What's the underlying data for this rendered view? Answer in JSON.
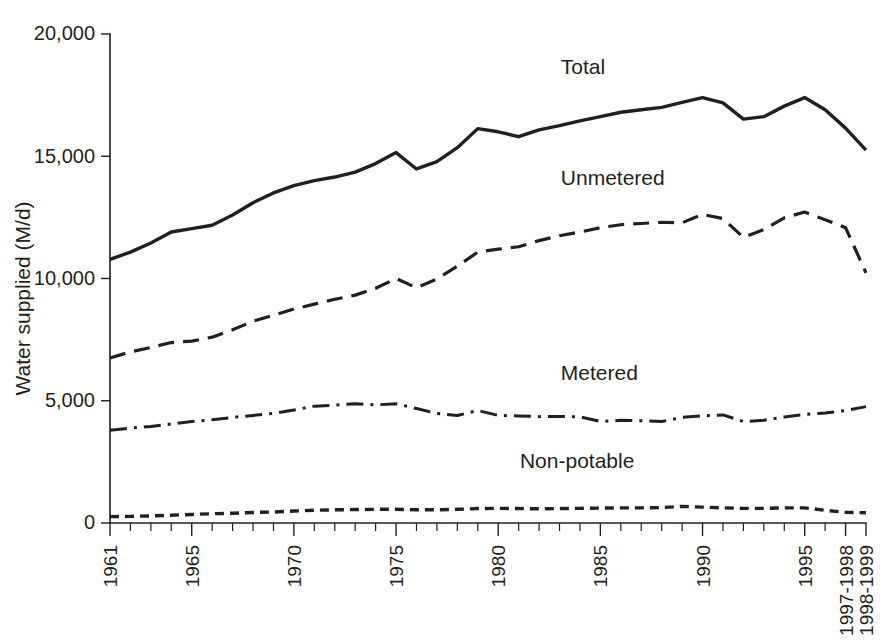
{
  "chart_data": {
    "type": "line",
    "title": "",
    "xlabel": "",
    "ylabel": "Water supplied (M/d)",
    "ylim": [
      0,
      20000
    ],
    "yticks": [
      0,
      5000,
      10000,
      15000,
      20000
    ],
    "ytick_labels": [
      "0",
      "5,000",
      "10,000",
      "15,000",
      "20,000"
    ],
    "grid": false,
    "legend_position": "inline-labels",
    "x": [
      "1961",
      "1962",
      "1963",
      "1964",
      "1965",
      "1966",
      "1967",
      "1968",
      "1969",
      "1970",
      "1971",
      "1972",
      "1973",
      "1974",
      "1975",
      "1976",
      "1977",
      "1978",
      "1979",
      "1980",
      "1981",
      "1982",
      "1983",
      "1984",
      "1985",
      "1986",
      "1987",
      "1988",
      "1989",
      "1990",
      "1991",
      "1992",
      "1993",
      "1994",
      "1995",
      "1996",
      "1997-1998",
      "1998-1999"
    ],
    "xtick_labels_shown": [
      "1961",
      "1965",
      "1970",
      "1975",
      "1980",
      "1985",
      "1990",
      "1995",
      "1997-1998",
      "1998-1999"
    ],
    "series": [
      {
        "name": "Total",
        "style": "solid",
        "label_x": "1986",
        "values": [
          10780,
          11080,
          11450,
          11900,
          12040,
          12180,
          12600,
          13100,
          13500,
          13800,
          14000,
          14150,
          14350,
          14700,
          15150,
          14480,
          14780,
          15350,
          16130,
          16000,
          15800,
          16080,
          16250,
          16450,
          16620,
          16800,
          16900,
          17000,
          17200,
          17400,
          17180,
          16520,
          16620,
          17050,
          17400,
          16900,
          16150,
          15250
        ]
      },
      {
        "name": "Unmetered",
        "style": "dashed",
        "label_x": "1986",
        "values": [
          6750,
          7000,
          7180,
          7380,
          7440,
          7600,
          7900,
          8250,
          8500,
          8750,
          8950,
          9150,
          9320,
          9600,
          10000,
          9620,
          9980,
          10500,
          11080,
          11200,
          11300,
          11550,
          11750,
          11900,
          12080,
          12200,
          12250,
          12300,
          12280,
          12620,
          12450,
          11680,
          12000,
          12480,
          12720,
          12400,
          12080,
          10230
        ]
      },
      {
        "name": "Metered",
        "style": "dashdot",
        "label_x": "1986",
        "values": [
          3790,
          3880,
          3950,
          4050,
          4150,
          4220,
          4320,
          4400,
          4480,
          4620,
          4780,
          4820,
          4880,
          4830,
          4880,
          4680,
          4480,
          4400,
          4600,
          4400,
          4380,
          4350,
          4360,
          4340,
          4150,
          4200,
          4180,
          4150,
          4320,
          4380,
          4420,
          4150,
          4200,
          4340,
          4440,
          4500,
          4600,
          4760
        ]
      },
      {
        "name": "Non-potable",
        "style": "dotted",
        "label_x": "1984",
        "values": [
          260,
          270,
          290,
          320,
          350,
          380,
          400,
          430,
          450,
          490,
          520,
          540,
          550,
          560,
          560,
          540,
          540,
          560,
          590,
          600,
          590,
          580,
          590,
          600,
          610,
          620,
          620,
          630,
          680,
          650,
          620,
          600,
          600,
          620,
          620,
          520,
          440,
          420
        ]
      }
    ]
  },
  "geometry": {
    "plot_left": 110,
    "plot_right": 866,
    "plot_top": 34,
    "plot_bottom": 523
  }
}
